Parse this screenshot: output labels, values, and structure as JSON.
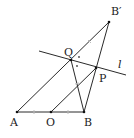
{
  "diagram": {
    "type": "geometry",
    "colors": {
      "line": "#2a2a2a",
      "tick": "#bbbbbb",
      "background": "#ffffff"
    },
    "points": {
      "A": {
        "label": "A",
        "x": 17,
        "y": 112
      },
      "O": {
        "label": "O",
        "x": 51,
        "y": 112
      },
      "B": {
        "label": "B",
        "x": 84,
        "y": 112
      },
      "Q": {
        "label": "Q",
        "x": 71,
        "y": 60
      },
      "P": {
        "label": "P",
        "x": 96,
        "y": 68
      },
      "Bp": {
        "label": "B′",
        "x": 109,
        "y": 22
      }
    },
    "line_l": {
      "label": "l"
    },
    "segments": [
      "A-B",
      "A-B′",
      "B-B′",
      "O-P",
      "Q-B",
      "line l"
    ],
    "marks": [
      "equal ticks on AO and OB",
      "equal ticks on QB′ and QB",
      "angle dots at Q"
    ]
  }
}
